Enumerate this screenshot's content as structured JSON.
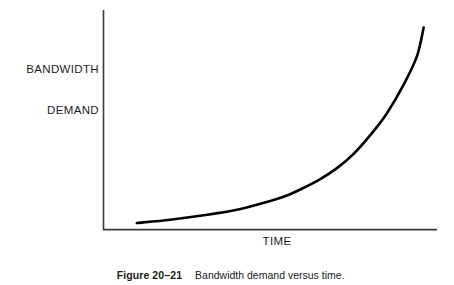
{
  "figure": {
    "caption_number": "Figure 20–21",
    "caption_text": "Bandwidth demand versus time."
  },
  "chart_data": {
    "type": "line",
    "title": "",
    "subtitle": "",
    "xlabel": "TIME",
    "ylabel": "BANDWIDTH\nDEMAND",
    "ylabel_line1": "BANDWIDTH",
    "ylabel_line2": "DEMAND",
    "grid": false,
    "legend": "none",
    "axis_ticks": "none",
    "xlim": [
      0,
      100
    ],
    "ylim": [
      0,
      100
    ],
    "series": [
      {
        "name": "Bandwidth demand",
        "color": "#000000",
        "x": [
          10,
          20,
          30,
          40,
          50,
          55,
          60,
          65,
          70,
          75,
          80,
          85,
          90,
          94,
          96
        ],
        "y": [
          3,
          4.5,
          6.5,
          9,
          13,
          15.5,
          19,
          23,
          28,
          34.5,
          43,
          53,
          66,
          79,
          92
        ]
      }
    ],
    "colors": {
      "curve": "#000000",
      "axis": "#3a3a3a",
      "background": "#ffffff",
      "text": "#1a1a1a"
    }
  }
}
